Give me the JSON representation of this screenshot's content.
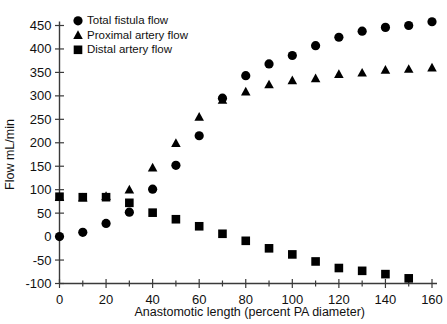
{
  "chart_data": {
    "type": "scatter",
    "title": "",
    "xlabel": "Anastomotic length (percent PA diameter)",
    "ylabel": "Flow mL/min",
    "xlim": [
      0,
      160
    ],
    "ylim": [
      -100,
      450
    ],
    "xticks": [
      0,
      20,
      40,
      60,
      80,
      100,
      120,
      140,
      160
    ],
    "xticklabels": [
      "0",
      "20",
      "40",
      "60",
      "80",
      "100",
      "120",
      "140",
      "160"
    ],
    "xminorticks": [
      10,
      30,
      50,
      70,
      90,
      110,
      130,
      150
    ],
    "yticks": [
      -100,
      -50,
      0,
      50,
      100,
      150,
      200,
      250,
      300,
      350,
      400,
      450
    ],
    "yticklabels": [
      "-100",
      "-50",
      "0",
      "50",
      "100",
      "150",
      "200",
      "250",
      "300",
      "350",
      "400",
      "450"
    ],
    "grid": false,
    "legend_position": "upper left",
    "x": [
      0,
      10,
      20,
      30,
      40,
      50,
      60,
      70,
      80,
      90,
      100,
      110,
      120,
      130,
      140,
      150,
      160
    ],
    "series": [
      {
        "name": "Total fistula flow",
        "marker": "circle",
        "color": "#000000",
        "values": [
          0,
          9,
          28,
          52,
          101,
          152,
          215,
          295,
          343,
          368,
          386,
          407,
          425,
          438,
          446,
          450,
          458
        ]
      },
      {
        "name": "Proximal artery flow",
        "marker": "triangle",
        "color": "#000000",
        "values": [
          84,
          83,
          86,
          100,
          147,
          199,
          255,
          291,
          309,
          324,
          333,
          337,
          346,
          349,
          355,
          357,
          360
        ]
      },
      {
        "name": "Distal artery flow",
        "marker": "square",
        "color": "#000000",
        "values": [
          85,
          84,
          84,
          72,
          51,
          37,
          22,
          6,
          -9,
          -25,
          -38,
          -53,
          -67,
          -73,
          -80,
          -89,
          null
        ]
      }
    ]
  },
  "legend": {
    "items": [
      {
        "label": "Total fistula flow",
        "marker": "circle"
      },
      {
        "label": "Proximal artery flow",
        "marker": "triangle"
      },
      {
        "label": "Distal artery flow",
        "marker": "square"
      }
    ]
  },
  "axes": {
    "x_title": "Anastomotic length (percent PA diameter)",
    "y_title": "Flow mL/min"
  }
}
